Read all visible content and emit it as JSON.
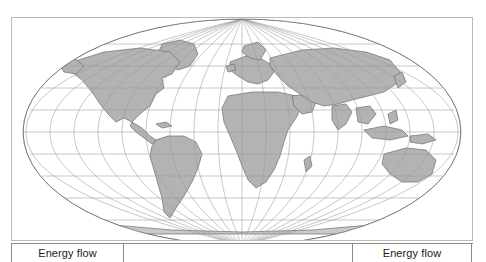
{
  "map": {
    "title": "World map",
    "projection": "mollweide",
    "graticule": {
      "meridian_step_deg": 15,
      "parallel_step_deg": 15,
      "line_color": "#9a9a9a"
    },
    "land_fill": "#b0b0b0",
    "land_outline": "#6e6e6e",
    "ocean_fill": "#ffffff",
    "frame_color": "#b9b9b9"
  },
  "table": {
    "rows": [
      {
        "cells": [
          {
            "label": "Energy flow"
          },
          {
            "label": ""
          },
          {
            "label": "Energy flow"
          }
        ]
      }
    ]
  },
  "colors": {
    "border": "#8c8c8c",
    "text": "#1a1a1a"
  }
}
